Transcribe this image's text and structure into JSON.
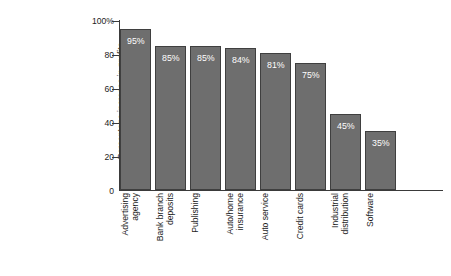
{
  "chart_data": {
    "type": "bar",
    "title": "",
    "subtitle": "",
    "xlabel": "",
    "ylabel": "Percentage increase in profits per customer",
    "ylabel_lines": [
      "Percentage increase in profits",
      "per customer"
    ],
    "categories": [
      "Advertising agency",
      "Bank branch deposits",
      "Publishing",
      "Auto/home insurance",
      "Auto service",
      "Credit cards",
      "Industrial distribution",
      "Software"
    ],
    "category_lines": [
      [
        "Advertising",
        "agency"
      ],
      [
        "Bank branch",
        "deposits"
      ],
      [
        "Publishing"
      ],
      [
        "Auto/home",
        "insurance"
      ],
      [
        "Auto service"
      ],
      [
        "Credit cards"
      ],
      [
        "Industrial",
        "distribution"
      ],
      [
        "Software"
      ]
    ],
    "values": [
      95,
      85,
      85,
      84,
      81,
      75,
      45,
      35
    ],
    "value_labels": [
      "95%",
      "85%",
      "85%",
      "84%",
      "81%",
      "75%",
      "45%",
      "35%"
    ],
    "ylim": [
      0,
      100
    ],
    "ytick_values": [
      0,
      20,
      40,
      60,
      80,
      100
    ],
    "ytick_labels": [
      "0",
      "20",
      "40",
      "60",
      "80",
      "100%"
    ],
    "grid": false,
    "legend": false,
    "legend_position": "none",
    "bar_color": "#6e6e6e",
    "bar_border_color": "#3f3f3f",
    "value_label_color": "#ffffff",
    "axis_color": "#3a3a3a",
    "text_color": "#1c1c1c",
    "background_color": "#ffffff"
  }
}
